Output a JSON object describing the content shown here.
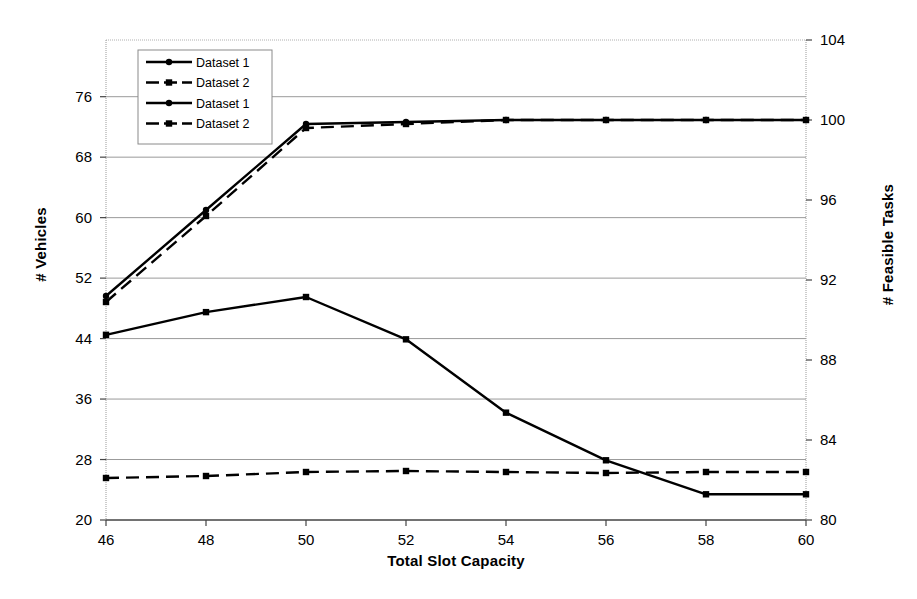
{
  "chart_data": {
    "type": "line",
    "title": "",
    "xlabel": "Total Slot Capacity",
    "ylabel": "# Vehicles",
    "ylabel_secondary": "# Feasible Tasks",
    "x": [
      46,
      48,
      50,
      52,
      54,
      56,
      58,
      60
    ],
    "xticks": [
      "46",
      "48",
      "50",
      "52",
      "54",
      "56",
      "58",
      "60"
    ],
    "xlim": [
      46,
      60
    ],
    "ylim": [
      20,
      83.5
    ],
    "yticks": [
      "20",
      "28",
      "36",
      "44",
      "52",
      "60",
      "68",
      "76"
    ],
    "ylim_secondary": [
      80,
      104
    ],
    "yticks_secondary": [
      "80",
      "84",
      "88",
      "92",
      "96",
      "100",
      "104"
    ],
    "grid": "horizontal",
    "legend_position": "top-left",
    "series": [
      {
        "name": "Dataset 1",
        "axis": "right",
        "style": "solid",
        "marker": "diamond",
        "color": "#000000",
        "values": [
          91.2,
          95.5,
          99.8,
          99.9,
          100.0,
          100.0,
          100.0,
          100.0
        ]
      },
      {
        "name": "Dataset 2",
        "axis": "right",
        "style": "dashed",
        "marker": "square",
        "color": "#000000",
        "values": [
          90.9,
          95.2,
          99.6,
          99.8,
          100.0,
          100.0,
          100.0,
          100.0
        ]
      },
      {
        "name": "Dataset 1",
        "axis": "left",
        "style": "solid",
        "marker": "square",
        "color": "#000000",
        "values": [
          44.5,
          47.5,
          49.5,
          43.9,
          34.2,
          27.9,
          23.4,
          23.4
        ]
      },
      {
        "name": "Dataset 2",
        "axis": "right",
        "style": "dashed",
        "marker": "square",
        "color": "#000000",
        "values": [
          82.1,
          82.2,
          82.4,
          82.45,
          82.4,
          82.35,
          82.4,
          82.4
        ]
      }
    ],
    "legend": [
      {
        "label": "Dataset 1",
        "style": "solid",
        "marker": "diamond"
      },
      {
        "label": "Dataset 2",
        "style": "dashed",
        "marker": "square"
      },
      {
        "label": "Dataset 1",
        "style": "solid",
        "marker": "diamond"
      },
      {
        "label": "Dataset 2",
        "style": "dashed",
        "marker": "square"
      }
    ]
  }
}
